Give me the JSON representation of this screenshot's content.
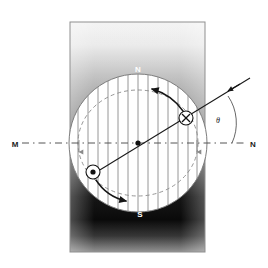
{
  "figure": {
    "canvas": {
      "width": 268,
      "height": 268,
      "background": "#ffffff"
    },
    "labels": {
      "pole_north": "N",
      "pole_south": "S",
      "axis_left": "M",
      "axis_right": "N",
      "angle": "θ"
    },
    "colors": {
      "page_background": "#ffffff",
      "pole_block_border": "#8f8f8f",
      "pole_top": "#f2f2f2",
      "pole_mid": "#8c8c8c",
      "pole_bottom": "#000000",
      "rotor_fill": "#ffffff",
      "rotor_stroke": "#7a7a7a",
      "field_line": "#8a8a8a",
      "coil_line": "#1a1a1a",
      "dashed_axis": "#555555",
      "dashed_ellipse": "#8a8a8a",
      "label_on_dark": "#ffffff",
      "label_on_light": "#1a1a1a"
    },
    "geometry": {
      "pole_block": {
        "x": 70,
        "y": 22,
        "width": 135,
        "height": 230
      },
      "rotor": {
        "cx": 138,
        "cy": 143,
        "r": 70
      },
      "centre_dot": {
        "cx": 138,
        "cy": 143,
        "r": 2.6
      },
      "neutral_axis": {
        "x1": 22,
        "y1": 143,
        "x2": 246,
        "y2": 143
      },
      "coil_plane_line": {
        "x1": 90,
        "y1": 176,
        "x2": 250,
        "y2": 78
      },
      "angle_degrees": 31
    },
    "markers": {
      "current_into_page": {
        "symbol": "×",
        "cx": 186,
        "cy": 118,
        "r": 7,
        "meaning": "current into page"
      },
      "current_out_of_page": {
        "symbol": "•",
        "cx": 93,
        "cy": 172,
        "r": 7,
        "meaning": "current out of page"
      }
    },
    "field_lines": {
      "direction": "downward",
      "count": 13,
      "note": "uniform field from N pole (top) to S pole (bottom)"
    },
    "rotation_arrows": {
      "upper": "counter-clockwise sweep near top-right",
      "lower": "counter-clockwise sweep near bottom-left"
    }
  }
}
